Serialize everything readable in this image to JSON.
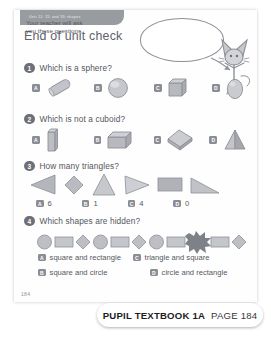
{
  "page": {
    "unit_tab": "Unit 11: 2D and 3D shapes",
    "title": "End of unit check",
    "folio": "184"
  },
  "speech_bubble": {
    "text": "Your teacher will ask you these questions."
  },
  "questions": [
    {
      "number": "1",
      "prompt": "Which is a sphere?",
      "options": [
        {
          "label": "A",
          "shape": "cylinder-rod"
        },
        {
          "label": "B",
          "shape": "sphere"
        },
        {
          "label": "C",
          "shape": "cube"
        },
        {
          "label": "D",
          "shape": "egg-ovoid"
        }
      ]
    },
    {
      "number": "2",
      "prompt": "Which is not a cuboid?",
      "options": [
        {
          "label": "A",
          "shape": "tall-cuboid"
        },
        {
          "label": "B",
          "shape": "cuboid"
        },
        {
          "label": "C",
          "shape": "tilted-cuboid"
        },
        {
          "label": "D",
          "shape": "pyramid"
        }
      ]
    },
    {
      "number": "3",
      "prompt": "How many triangles?",
      "figures": [
        "triangle-left",
        "diamond",
        "triangle-up",
        "triangle-right",
        "rectangle",
        "triangle-right-angle"
      ],
      "answers": [
        {
          "label": "A",
          "text": "6"
        },
        {
          "label": "B",
          "text": "1"
        },
        {
          "label": "C",
          "text": "4"
        },
        {
          "label": "D",
          "text": "0"
        }
      ]
    },
    {
      "number": "4",
      "prompt": "Which shapes are hidden?",
      "figures": [
        "circle",
        "rectangle",
        "diamond",
        "circle",
        "rectangle",
        "diamond",
        "circle",
        "rectangle",
        "blob",
        "rectangle",
        "diamond"
      ],
      "answers": [
        {
          "label": "A",
          "text": "square and rectangle"
        },
        {
          "label": "B",
          "text": "square and circle"
        },
        {
          "label": "C",
          "text": "triangle and square"
        },
        {
          "label": "D",
          "text": "circle and rectangle"
        }
      ]
    }
  ],
  "banner": {
    "book": "PUPIL TEXTBOOK 1A",
    "page": "PAGE 184"
  },
  "colors": {
    "shape_fill": "#b9bbc0",
    "shape_stroke": "#8e9197",
    "badge": "#8a8d93",
    "num_circle": "#6d7076",
    "text": "#55585e",
    "tab": "#909399",
    "blob": "#7e8188"
  }
}
